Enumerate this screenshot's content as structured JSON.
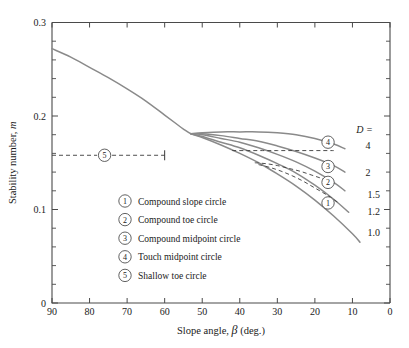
{
  "chart_data": {
    "type": "line",
    "title": "",
    "xlabel": "Slope angle, β (deg.)",
    "ylabel": "Stability number, m",
    "xlim": [
      90,
      0
    ],
    "ylim": [
      0,
      0.3
    ],
    "x_reversed": true,
    "grid": false,
    "legend_position": "inside-lower-center",
    "xticks": [
      90,
      80,
      70,
      60,
      50,
      40,
      30,
      20,
      10,
      0
    ],
    "xtick_labels": [
      "90",
      "80",
      "70",
      "60",
      "50",
      "40",
      "30",
      "20",
      "10",
      "0"
    ],
    "yticks": [
      0,
      0.1,
      0.2,
      0.3
    ],
    "ytick_labels": [
      "0",
      "0.1",
      "0.2",
      "0.3"
    ],
    "y_minor_tick_step": 0.02,
    "x_minor_ticks": false,
    "series": [
      {
        "name": "D = 1.0",
        "label": "1.0",
        "style": "solid",
        "color": "#8a8a8a",
        "x": [
          90,
          85,
          80,
          75,
          70,
          65,
          60,
          57,
          55,
          53,
          50,
          45,
          40,
          35,
          30,
          25,
          20,
          15,
          10,
          8
        ],
        "y": [
          0.272,
          0.263,
          0.252,
          0.241,
          0.229,
          0.216,
          0.201,
          0.192,
          0.186,
          0.181,
          0.177,
          0.169,
          0.16,
          0.15,
          0.138,
          0.125,
          0.11,
          0.093,
          0.074,
          0.065
        ]
      },
      {
        "name": "D = 1.2",
        "label": "1.2",
        "style": "solid",
        "color": "#8a8a8a",
        "x": [
          53,
          50,
          45,
          40,
          35,
          30,
          25,
          20,
          15,
          11
        ],
        "y": [
          0.181,
          0.178,
          0.172,
          0.166,
          0.158,
          0.149,
          0.139,
          0.126,
          0.111,
          0.097
        ]
      },
      {
        "name": "D = 1.5",
        "label": "1.5",
        "style": "solid",
        "color": "#8a8a8a",
        "x": [
          53,
          50,
          45,
          40,
          35,
          30,
          25,
          20,
          15,
          12
        ],
        "y": [
          0.181,
          0.18,
          0.176,
          0.172,
          0.166,
          0.159,
          0.151,
          0.141,
          0.129,
          0.12
        ]
      },
      {
        "name": "D = 2",
        "label": "2",
        "style": "solid",
        "color": "#8a8a8a",
        "x": [
          53,
          50,
          45,
          40,
          35,
          30,
          25,
          20,
          15,
          12
        ],
        "y": [
          0.181,
          0.181,
          0.179,
          0.176,
          0.173,
          0.168,
          0.162,
          0.155,
          0.147,
          0.14
        ]
      },
      {
        "name": "D = 4",
        "label": "4",
        "style": "solid",
        "color": "#8a8a8a",
        "x": [
          53,
          50,
          45,
          40,
          35,
          30,
          25,
          20,
          15,
          12
        ],
        "y": [
          0.181,
          0.182,
          0.183,
          0.183,
          0.183,
          0.182,
          0.18,
          0.176,
          0.17,
          0.165
        ]
      }
    ],
    "dashed_series": [
      {
        "name": "transition-upper",
        "style": "dashed",
        "x": [
          42,
          38,
          34,
          30,
          26,
          22,
          18,
          15
        ],
        "y": [
          0.163,
          0.163,
          0.163,
          0.163,
          0.163,
          0.163,
          0.163,
          0.163
        ]
      },
      {
        "name": "transition-mid",
        "style": "dashed",
        "x": [
          36,
          33,
          30,
          27,
          24,
          21,
          18,
          15
        ],
        "y": [
          0.15,
          0.149,
          0.147,
          0.144,
          0.141,
          0.137,
          0.133,
          0.129
        ]
      },
      {
        "name": "transition-lower",
        "style": "dashed",
        "x": [
          35,
          32,
          29,
          26,
          23,
          20,
          17,
          14
        ],
        "y": [
          0.148,
          0.145,
          0.141,
          0.136,
          0.13,
          0.123,
          0.116,
          0.108
        ]
      }
    ],
    "shallow_toe_line": {
      "name": "Shallow toe circle reference",
      "style": "dashed",
      "y": 0.158,
      "x_start": 90,
      "x_end": 60,
      "end_cap_tick": true,
      "marker": "5",
      "marker_x": 76
    },
    "curve_markers": [
      {
        "num": "1",
        "x": 16.5,
        "y": 0.107
      },
      {
        "num": "2",
        "x": 16.5,
        "y": 0.129
      },
      {
        "num": "3",
        "x": 16.5,
        "y": 0.146
      },
      {
        "num": "4",
        "x": 16.5,
        "y": 0.172
      }
    ],
    "curve_end_labels": [
      {
        "text": "D =",
        "x": 9.0,
        "y": 0.186,
        "italic": true
      },
      {
        "text": "4",
        "x": 6.5,
        "y": 0.168
      },
      {
        "text": "2",
        "x": 6.5,
        "y": 0.14
      },
      {
        "text": "1.5",
        "x": 6.0,
        "y": 0.116
      },
      {
        "text": "1.2",
        "x": 6.0,
        "y": 0.098
      },
      {
        "text": "1.0",
        "x": 6.0,
        "y": 0.075
      }
    ],
    "legend_entries": [
      {
        "num": "1",
        "label": "Compound slope circle"
      },
      {
        "num": "2",
        "label": "Compound toe circle"
      },
      {
        "num": "3",
        "label": "Compound midpoint circle"
      },
      {
        "num": "4",
        "label": "Touch midpoint circle"
      },
      {
        "num": "5",
        "label": "Shallow toe circle"
      }
    ],
    "colors": {
      "curve": "#8a8a8a",
      "dashed": "#3a3a3a",
      "axis": "#4a4a4a",
      "text": "#1a1a1a",
      "background": "#ffffff"
    }
  }
}
